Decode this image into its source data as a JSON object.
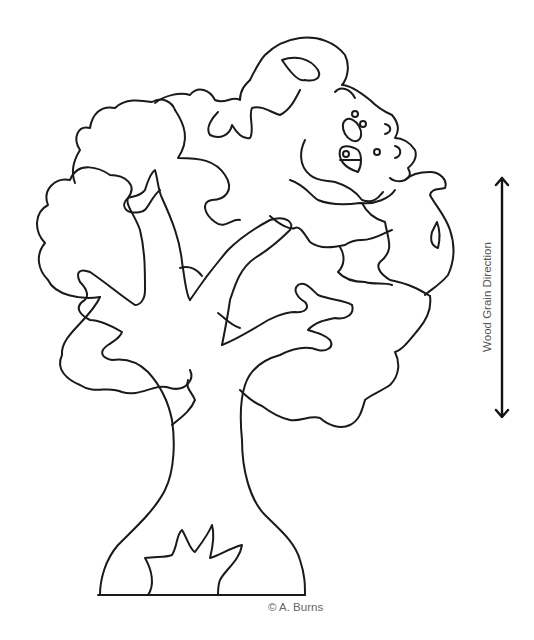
{
  "pattern": {
    "title": "Tree and monkey puzzle pattern",
    "grain_direction_label": "Wood Grain Direction",
    "credit": "© A. Burns",
    "line_color": "#1a1a1a",
    "icons": [
      "double-arrow-icon"
    ]
  }
}
